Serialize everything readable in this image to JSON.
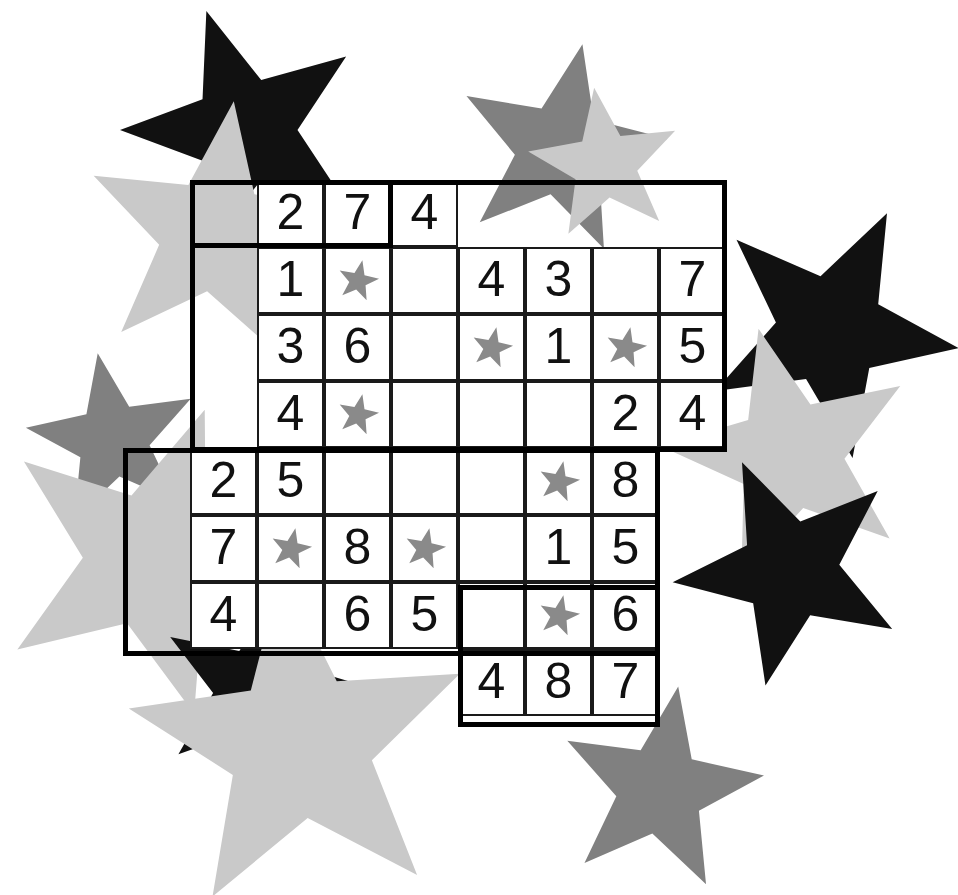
{
  "puzzle": {
    "title": "Star Sudoku Irregular Grid Puzzle",
    "type": "irregular-sudoku",
    "rows": 8,
    "columns": 8,
    "cell_size": 67,
    "grid_origin": {
      "x": 190,
      "y": 180
    },
    "star_glyph": "star-icon",
    "colors": {
      "cell_background": "#ffffff",
      "cell_border": "#1a1a1a",
      "outer_border": "#000000",
      "digit": "#111111",
      "cell_star": "#8a8a8a",
      "bg_star_black": "#111111",
      "bg_star_dark_gray": "#808080",
      "bg_star_light_gray": "#c9c9c9",
      "page_background": "#ffffff"
    },
    "cells": [
      {
        "row": 1,
        "col": 2,
        "value": "2",
        "kind": "digit"
      },
      {
        "row": 1,
        "col": 3,
        "value": "7",
        "kind": "digit"
      },
      {
        "row": 1,
        "col": 4,
        "value": "4",
        "kind": "digit"
      },
      {
        "row": 2,
        "col": 2,
        "value": "1",
        "kind": "digit"
      },
      {
        "row": 2,
        "col": 3,
        "value": "",
        "kind": "star"
      },
      {
        "row": 2,
        "col": 4,
        "value": "",
        "kind": "empty"
      },
      {
        "row": 2,
        "col": 5,
        "value": "4",
        "kind": "digit"
      },
      {
        "row": 2,
        "col": 6,
        "value": "3",
        "kind": "digit"
      },
      {
        "row": 2,
        "col": 7,
        "value": "",
        "kind": "empty"
      },
      {
        "row": 2,
        "col": 8,
        "value": "7",
        "kind": "digit"
      },
      {
        "row": 3,
        "col": 2,
        "value": "3",
        "kind": "digit"
      },
      {
        "row": 3,
        "col": 3,
        "value": "6",
        "kind": "digit"
      },
      {
        "row": 3,
        "col": 4,
        "value": "",
        "kind": "empty"
      },
      {
        "row": 3,
        "col": 5,
        "value": "",
        "kind": "star"
      },
      {
        "row": 3,
        "col": 6,
        "value": "1",
        "kind": "digit"
      },
      {
        "row": 3,
        "col": 7,
        "value": "",
        "kind": "star"
      },
      {
        "row": 3,
        "col": 8,
        "value": "5",
        "kind": "digit"
      },
      {
        "row": 4,
        "col": 2,
        "value": "4",
        "kind": "digit"
      },
      {
        "row": 4,
        "col": 3,
        "value": "",
        "kind": "star"
      },
      {
        "row": 4,
        "col": 4,
        "value": "",
        "kind": "empty"
      },
      {
        "row": 4,
        "col": 5,
        "value": "",
        "kind": "empty"
      },
      {
        "row": 4,
        "col": 6,
        "value": "",
        "kind": "empty"
      },
      {
        "row": 4,
        "col": 7,
        "value": "2",
        "kind": "digit"
      },
      {
        "row": 4,
        "col": 8,
        "value": "4",
        "kind": "digit"
      },
      {
        "row": 5,
        "col": 1,
        "value": "2",
        "kind": "digit"
      },
      {
        "row": 5,
        "col": 2,
        "value": "5",
        "kind": "digit"
      },
      {
        "row": 5,
        "col": 3,
        "value": "",
        "kind": "empty"
      },
      {
        "row": 5,
        "col": 4,
        "value": "",
        "kind": "empty"
      },
      {
        "row": 5,
        "col": 5,
        "value": "",
        "kind": "empty"
      },
      {
        "row": 5,
        "col": 6,
        "value": "",
        "kind": "star"
      },
      {
        "row": 5,
        "col": 7,
        "value": "8",
        "kind": "digit"
      },
      {
        "row": 6,
        "col": 1,
        "value": "7",
        "kind": "digit"
      },
      {
        "row": 6,
        "col": 2,
        "value": "",
        "kind": "star"
      },
      {
        "row": 6,
        "col": 3,
        "value": "8",
        "kind": "digit"
      },
      {
        "row": 6,
        "col": 4,
        "value": "",
        "kind": "star"
      },
      {
        "row": 6,
        "col": 5,
        "value": "",
        "kind": "empty"
      },
      {
        "row": 6,
        "col": 6,
        "value": "1",
        "kind": "digit"
      },
      {
        "row": 6,
        "col": 7,
        "value": "5",
        "kind": "digit"
      },
      {
        "row": 7,
        "col": 1,
        "value": "4",
        "kind": "digit"
      },
      {
        "row": 7,
        "col": 2,
        "value": "",
        "kind": "empty"
      },
      {
        "row": 7,
        "col": 3,
        "value": "6",
        "kind": "digit"
      },
      {
        "row": 7,
        "col": 4,
        "value": "5",
        "kind": "digit"
      },
      {
        "row": 7,
        "col": 5,
        "value": "",
        "kind": "empty"
      },
      {
        "row": 7,
        "col": 6,
        "value": "",
        "kind": "star"
      },
      {
        "row": 7,
        "col": 7,
        "value": "6",
        "kind": "digit"
      },
      {
        "row": 8,
        "col": 5,
        "value": "4",
        "kind": "digit"
      },
      {
        "row": 8,
        "col": 6,
        "value": "8",
        "kind": "digit"
      },
      {
        "row": 8,
        "col": 7,
        "value": "7",
        "kind": "digit"
      }
    ],
    "outline_segments": [
      {
        "name": "top-block",
        "x": 190,
        "y": 180,
        "w": 203,
        "h": 68
      },
      {
        "name": "upper-right",
        "x": 190,
        "y": 180,
        "w": 537,
        "h": 272
      },
      {
        "name": "lower-left",
        "x": 123,
        "y": 448,
        "w": 537,
        "h": 208
      },
      {
        "name": "bottom-block",
        "x": 458,
        "y": 585,
        "w": 202,
        "h": 142
      }
    ]
  },
  "background_stars": [
    {
      "name": "bg-star-top-left-black",
      "cx": 245,
      "cy": 130,
      "r": 125,
      "rot": -18,
      "color": "#111111"
    },
    {
      "name": "bg-star-top-left-light",
      "cx": 215,
      "cy": 235,
      "r": 135,
      "rot": 8,
      "color": "#c9c9c9"
    },
    {
      "name": "bg-star-top-mid-dark",
      "cx": 560,
      "cy": 150,
      "r": 108,
      "rot": 12,
      "color": "#808080"
    },
    {
      "name": "bg-star-top-mid-light",
      "cx": 605,
      "cy": 165,
      "r": 78,
      "rot": -8,
      "color": "#c9c9c9"
    },
    {
      "name": "bg-star-left-dark",
      "cx": 113,
      "cy": 440,
      "r": 88,
      "rot": -10,
      "color": "#808080"
    },
    {
      "name": "bg-star-left-light",
      "cx": 150,
      "cy": 560,
      "r": 160,
      "rot": 20,
      "color": "#c9c9c9"
    },
    {
      "name": "bg-star-right-black",
      "cx": 830,
      "cy": 330,
      "r": 130,
      "rot": 26,
      "color": "#111111"
    },
    {
      "name": "bg-star-right-light",
      "cx": 790,
      "cy": 455,
      "r": 130,
      "rot": -14,
      "color": "#c9c9c9"
    },
    {
      "name": "bg-star-right-black-low",
      "cx": 790,
      "cy": 570,
      "r": 118,
      "rot": 48,
      "color": "#111111"
    },
    {
      "name": "bg-star-bottom-left-black",
      "cx": 255,
      "cy": 690,
      "r": 100,
      "rot": 14,
      "color": "#111111"
    },
    {
      "name": "bg-star-bottom-light",
      "cx": 300,
      "cy": 745,
      "r": 175,
      "rot": -6,
      "color": "#c9c9c9"
    },
    {
      "name": "bg-star-bottom-mid-dark",
      "cx": 660,
      "cy": 790,
      "r": 105,
      "rot": 10,
      "color": "#808080"
    }
  ]
}
